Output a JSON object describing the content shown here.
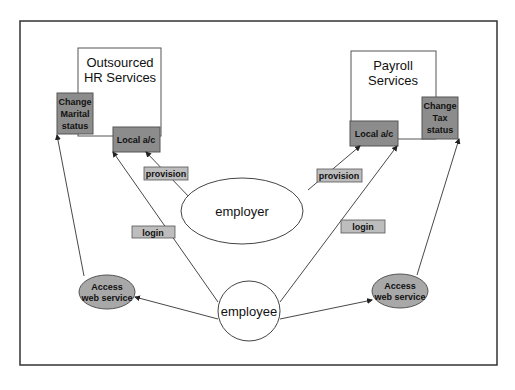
{
  "diagram": {
    "colors": {
      "frame": "#333333",
      "box_dark": "#8c8c8c",
      "box_light": "#bdbdbd",
      "ellipse_fill_gray": "#a8a8a8",
      "line": "#333333"
    },
    "services": {
      "hr": {
        "title_line1": "Outsourced",
        "title_line2": "HR Services"
      },
      "payroll": {
        "title_line1": "Payroll",
        "title_line2": "Services"
      }
    },
    "boxes": {
      "change_marital": {
        "line1": "Change",
        "line2": "Marital",
        "line3": "status"
      },
      "hr_local_ac": {
        "label": "Local a/c"
      },
      "payroll_local_ac": {
        "label": "Local a/c"
      },
      "change_tax": {
        "line1": "Change",
        "line2": "Tax",
        "line3": "status"
      }
    },
    "edge_labels": {
      "provision_left": "provision",
      "provision_right": "provision",
      "login_left": "login",
      "login_right": "login"
    },
    "nodes": {
      "employer": "employer",
      "employee": "employee",
      "access_left": {
        "line1": "Access",
        "line2": "web service"
      },
      "access_right": {
        "line1": "Access",
        "line2": "web service"
      }
    }
  }
}
